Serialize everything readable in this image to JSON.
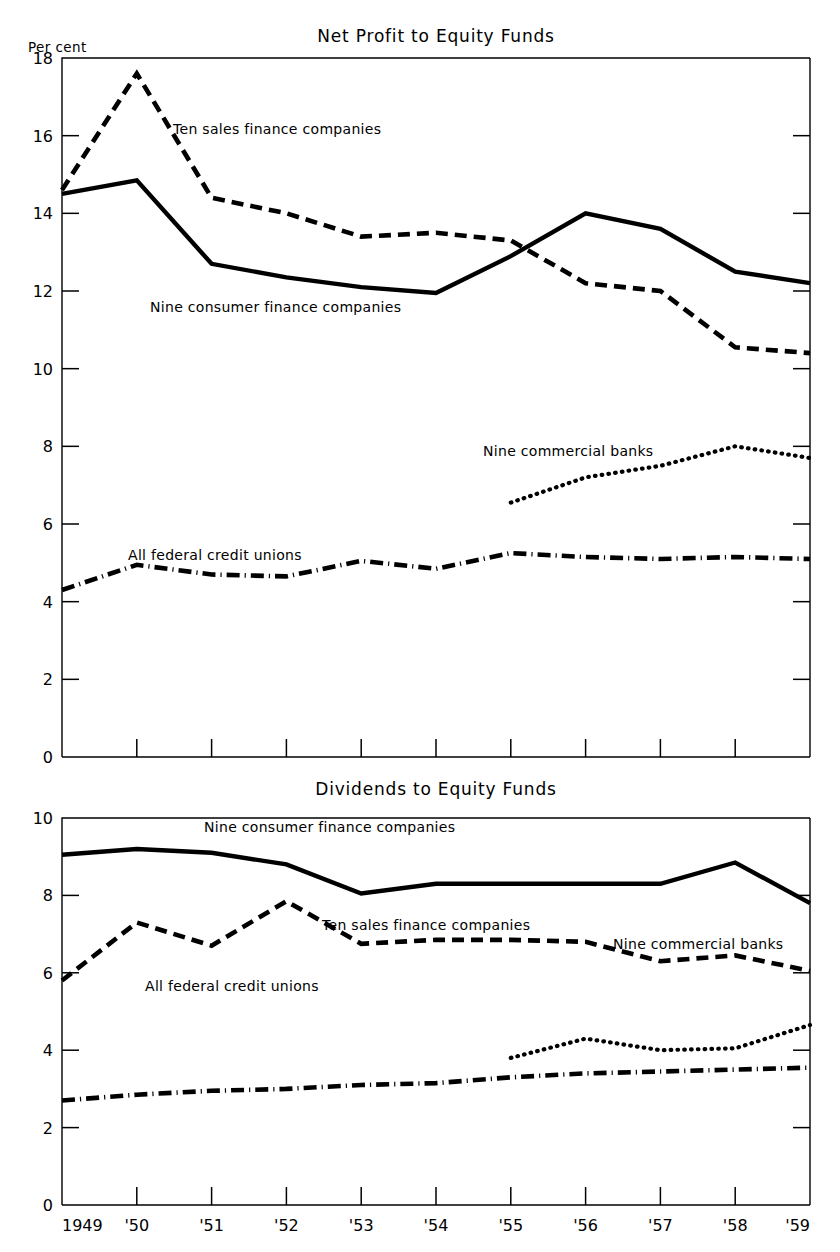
{
  "charts": {
    "top": {
      "title": "Net Profit to Equity Funds",
      "axis_unit": "Per cent",
      "y_ticks": [
        "18",
        "16",
        "14",
        "12",
        "10",
        "8",
        "6",
        "4",
        "2",
        "0"
      ],
      "labels": {
        "sales_finance": "Ten sales finance companies",
        "consumer_finance": "Nine consumer finance companies",
        "commercial_banks": "Nine commercial banks",
        "credit_unions": "All federal credit unions"
      }
    },
    "bottom": {
      "title": "Dividends to Equity Funds",
      "y_ticks": [
        "10",
        "8",
        "6",
        "4",
        "2",
        "0"
      ],
      "labels": {
        "consumer_finance": "Nine consumer finance companies",
        "sales_finance": "Ten sales finance companies",
        "commercial_banks": "Nine commercial banks",
        "credit_unions": "All federal credit unions"
      },
      "x_ticks": [
        "1949",
        "'50",
        "'51",
        "'52",
        "'53",
        "'54",
        "'55",
        "'56",
        "'57",
        "'58",
        "'59"
      ]
    }
  },
  "chart_data": [
    {
      "type": "line",
      "title": "Net Profit to Equity Funds",
      "xlabel": "",
      "ylabel": "Per cent",
      "x": [
        1949,
        1950,
        1951,
        1952,
        1953,
        1954,
        1955,
        1956,
        1957,
        1958,
        1959
      ],
      "x_tick_labels": [
        "1949",
        "'50",
        "'51",
        "'52",
        "'53",
        "'54",
        "'55",
        "'56",
        "'57",
        "'58",
        "'59"
      ],
      "ylim": [
        0,
        18
      ],
      "y_tick_values": [
        0,
        2,
        4,
        6,
        8,
        10,
        12,
        14,
        16,
        18
      ],
      "grid": false,
      "legend": "inline-annotations",
      "series": [
        {
          "name": "Ten sales finance companies",
          "style": "dashed",
          "values": [
            14.6,
            17.6,
            14.4,
            14.0,
            13.4,
            13.5,
            13.3,
            12.2,
            12.0,
            10.55,
            10.4
          ]
        },
        {
          "name": "Nine consumer finance companies",
          "style": "solid",
          "values": [
            14.5,
            14.85,
            12.7,
            12.35,
            12.1,
            11.95,
            12.9,
            14.0,
            13.6,
            12.5,
            12.2
          ]
        },
        {
          "name": "Nine commercial banks",
          "style": "dotted",
          "x": [
            1955,
            1956,
            1957,
            1958,
            1959
          ],
          "values": [
            6.55,
            7.2,
            7.5,
            8.0,
            7.7
          ]
        },
        {
          "name": "All federal credit unions",
          "style": "dash-dot",
          "values": [
            4.3,
            4.95,
            4.7,
            4.65,
            5.05,
            4.85,
            5.25,
            5.15,
            5.1,
            5.15,
            5.1
          ]
        }
      ]
    },
    {
      "type": "line",
      "title": "Dividends to Equity Funds",
      "xlabel": "",
      "ylabel": "Per cent",
      "x": [
        1949,
        1950,
        1951,
        1952,
        1953,
        1954,
        1955,
        1956,
        1957,
        1958,
        1959
      ],
      "x_tick_labels": [
        "1949",
        "'50",
        "'51",
        "'52",
        "'53",
        "'54",
        "'55",
        "'56",
        "'57",
        "'58",
        "'59"
      ],
      "ylim": [
        0,
        10
      ],
      "y_tick_values": [
        0,
        2,
        4,
        6,
        8,
        10
      ],
      "grid": false,
      "legend": "inline-annotations",
      "series": [
        {
          "name": "Nine consumer finance companies",
          "style": "solid",
          "values": [
            9.05,
            9.2,
            9.1,
            8.8,
            8.05,
            8.3,
            8.3,
            8.3,
            8.3,
            8.85,
            7.8
          ]
        },
        {
          "name": "Ten sales finance companies",
          "style": "dashed",
          "values": [
            5.8,
            7.3,
            6.7,
            7.85,
            6.75,
            6.85,
            6.85,
            6.8,
            6.3,
            6.45,
            6.05
          ]
        },
        {
          "name": "Nine commercial banks",
          "style": "dotted",
          "x": [
            1955,
            1956,
            1957,
            1958,
            1959
          ],
          "values": [
            3.8,
            4.3,
            4.0,
            4.05,
            4.65
          ]
        },
        {
          "name": "All federal credit unions",
          "style": "dash-dot",
          "values": [
            2.7,
            2.85,
            2.95,
            3.0,
            3.1,
            3.15,
            3.3,
            3.4,
            3.45,
            3.5,
            3.55
          ]
        }
      ]
    }
  ]
}
